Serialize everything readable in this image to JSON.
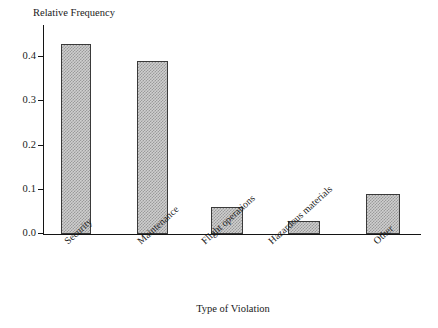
{
  "chart_data": {
    "type": "bar",
    "title": "",
    "ylabel": "Relative Frequency",
    "xlabel": "Type of Violation",
    "categories": [
      "Security",
      "Maintenance",
      "Flight operations",
      "Hazardous materials",
      "Other"
    ],
    "values": [
      0.43,
      0.39,
      0.06,
      0.03,
      0.09
    ],
    "ylim": [
      0.0,
      0.45
    ],
    "yticks": [
      "0.0",
      "0.1",
      "0.2",
      "0.3",
      "0.4"
    ],
    "ytick_values": [
      0.0,
      0.1,
      0.2,
      0.3,
      0.4
    ],
    "grid": false,
    "legend": false,
    "legend_position": "none",
    "bar_fill": "#cfcfcf",
    "bar_edge": "#3a3a3a",
    "axis_color": "#141414",
    "background": "#ffffff",
    "category_label_rotation": -42
  }
}
